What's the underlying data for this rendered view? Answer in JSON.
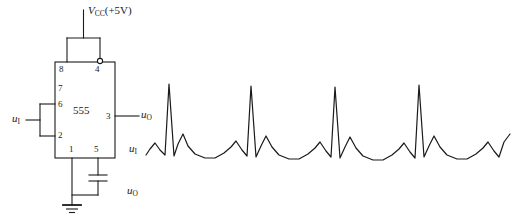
{
  "figure": {
    "kind": "circuit-schematic-with-waveform",
    "stroke_color": "#1a1a1a",
    "background_color": "#ffffff"
  },
  "circuit": {
    "chip": {
      "name": "555",
      "supply_label_v": "V",
      "supply_label_sub": "CC",
      "supply_label_value": "(+5V)",
      "pins": [
        {
          "number": "8",
          "side": "top-left"
        },
        {
          "number": "4",
          "side": "top-right"
        },
        {
          "number": "7",
          "side": "left"
        },
        {
          "number": "6",
          "side": "left"
        },
        {
          "number": "2",
          "side": "left"
        },
        {
          "number": "3",
          "side": "right"
        },
        {
          "number": "1",
          "side": "bottom-left"
        },
        {
          "number": "5",
          "side": "bottom-right"
        }
      ]
    },
    "input_label": {
      "symbol": "u",
      "subscript": "I"
    },
    "output_label": {
      "symbol": "u",
      "subscript": "O"
    },
    "waveform_label_input": {
      "symbol": "u",
      "subscript": "I"
    },
    "waveform_label_output": {
      "symbol": "u",
      "subscript": "O"
    }
  },
  "chart_data": {
    "type": "line",
    "title": "",
    "xlabel": "",
    "ylabel": "",
    "grid": false,
    "legend": "none",
    "series": [
      {
        "name": "u_I",
        "comment": "ECG-like periodic input waveform, pixel polyline in screen coords (y down)",
        "points": [
          [
            146,
            155
          ],
          [
            150,
            149
          ],
          [
            155,
            143
          ],
          [
            160,
            150
          ],
          [
            165,
            155
          ],
          [
            169,
            84
          ],
          [
            174,
            156
          ],
          [
            178,
            144
          ],
          [
            183,
            134
          ],
          [
            188,
            146
          ],
          [
            195,
            154
          ],
          [
            205,
            158
          ],
          [
            215,
            158
          ],
          [
            224,
            153
          ],
          [
            231,
            147
          ],
          [
            236,
            141
          ],
          [
            242,
            150
          ],
          [
            247,
            156
          ],
          [
            251,
            86
          ],
          [
            256,
            157
          ],
          [
            261,
            146
          ],
          [
            266,
            136
          ],
          [
            272,
            147
          ],
          [
            279,
            155
          ],
          [
            289,
            159
          ],
          [
            299,
            159
          ],
          [
            308,
            154
          ],
          [
            315,
            148
          ],
          [
            320,
            142
          ],
          [
            326,
            151
          ],
          [
            331,
            157
          ],
          [
            335,
            87
          ],
          [
            340,
            158
          ],
          [
            345,
            147
          ],
          [
            350,
            137
          ],
          [
            356,
            148
          ],
          [
            363,
            156
          ],
          [
            373,
            160
          ],
          [
            383,
            160
          ],
          [
            392,
            155
          ],
          [
            399,
            149
          ],
          [
            404,
            143
          ],
          [
            410,
            152
          ],
          [
            415,
            158
          ],
          [
            419,
            85
          ],
          [
            424,
            157
          ],
          [
            429,
            146
          ],
          [
            434,
            136
          ],
          [
            440,
            147
          ],
          [
            447,
            155
          ],
          [
            457,
            159
          ],
          [
            467,
            159
          ],
          [
            476,
            154
          ],
          [
            483,
            148
          ],
          [
            488,
            142
          ],
          [
            494,
            151
          ],
          [
            499,
            157
          ],
          [
            504,
            142
          ],
          [
            510,
            134
          ]
        ]
      }
    ]
  }
}
